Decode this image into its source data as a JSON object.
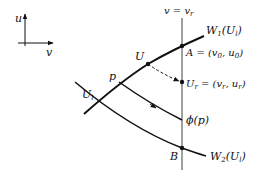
{
  "diagram": {
    "axes": {
      "vertical_label": "u",
      "horizontal_label": "v"
    },
    "vertical_line": {
      "label": "v = v",
      "label_sub": "r"
    },
    "curves": {
      "w1": {
        "label_main": "W",
        "label_sub": "1",
        "label_arg": "(U",
        "label_arg_sub": "l",
        "label_close": ")"
      },
      "w2": {
        "label_main": "W",
        "label_sub": "2",
        "label_arg": "(U",
        "label_arg_sub": "l",
        "label_close": ")"
      },
      "phi": {
        "label": "ϕ(p)"
      }
    },
    "points": {
      "U": {
        "label": "U"
      },
      "A": {
        "label": "A = (v",
        "sub1": "0",
        "mid": ", u",
        "sub2": "0",
        "end": ")"
      },
      "Ur": {
        "label": "U",
        "sub": "r",
        "eq": " = (v",
        "sub1": "r",
        "mid": ", u",
        "sub2": "r",
        "end": ")"
      },
      "p": {
        "label": "p"
      },
      "Ul": {
        "label": "U",
        "sub": "l"
      },
      "B": {
        "label": "B"
      }
    },
    "colors": {
      "ink": "#111111",
      "background": "#ffffff"
    }
  }
}
